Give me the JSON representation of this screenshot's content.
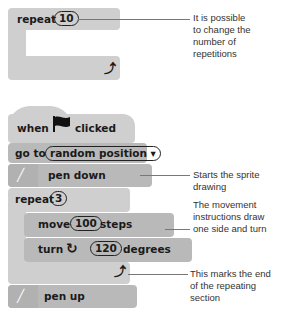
{
  "top_example": {
    "repeat_label": "repeat",
    "repeat_count": "10",
    "loop_arrow": "loop-arrow-icon",
    "annotation": [
      "It is possible",
      "to change the",
      "number of",
      "repetitions"
    ]
  },
  "script": {
    "hat": {
      "when": "when",
      "flag": "green-flag-icon",
      "clicked": "clicked"
    },
    "goto": {
      "label": "go to",
      "dropdown": "random position ▾"
    },
    "pen_down": {
      "label": "pen down"
    },
    "repeat": {
      "label": "repeat",
      "count": "3"
    },
    "move": {
      "label": "move",
      "value": "100",
      "unit": "steps"
    },
    "turn": {
      "label": "turn",
      "value": "120",
      "unit": "degrees"
    },
    "pen_up": {
      "label": "pen up"
    }
  },
  "annotations": {
    "pen_down": [
      "Starts the sprite",
      "drawing"
    ],
    "movement": [
      "The movement",
      "instructions draw",
      "one side and turn"
    ],
    "loop_end": [
      "This marks the end",
      "of the repeating",
      "section"
    ]
  },
  "colors": {
    "block": "#cfcfcf",
    "block_dark": "#b9b9b9",
    "text": "#1a1a1a",
    "line": "#777777"
  }
}
